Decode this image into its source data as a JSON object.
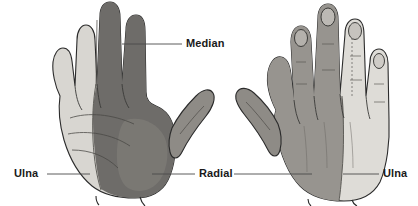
{
  "figure": {
    "background_color": "#ffffff",
    "width": 418,
    "height": 206,
    "views": [
      {
        "id": "left-hand-palmar",
        "name": "Left hand, palmar (volar) view",
        "territories": [
          {
            "nerve": "Ulna",
            "region": "ulnar side: little finger and half of ring finger, hypothenar palm",
            "shade": "#d8d6d1"
          },
          {
            "nerve": "Median",
            "region": "thumb, index, middle and radial half of ring finger, thenar palm",
            "shade": "#6e6c69"
          }
        ]
      },
      {
        "id": "right-hand-dorsal",
        "name": "Right hand, dorsal view",
        "territories": [
          {
            "nerve": "Radial",
            "region": "radial dorsum: thumb, index, middle finger dorsum",
            "shade": "#97948f"
          },
          {
            "nerve": "Ulna",
            "region": "ulnar dorsum: little finger and half of ring finger",
            "shade": "#dedcd7"
          }
        ]
      }
    ]
  },
  "labels": {
    "median": "Median",
    "ulna_left": "Ulna",
    "radial": "Radial",
    "ulna_right": "Ulna"
  },
  "colors": {
    "background": "#ffffff",
    "text": "#1a1a1a",
    "outline": "#2b2b2b",
    "leader_line": "#4a4a4a",
    "median_fill": "#6e6c69",
    "ulnar_fill_palmar": "#d8d6d1",
    "radial_fill_dorsal": "#97948f",
    "ulnar_fill_dorsal": "#dedcd7",
    "thumb_fill": "#8e8b86",
    "crease": "#55534f"
  }
}
